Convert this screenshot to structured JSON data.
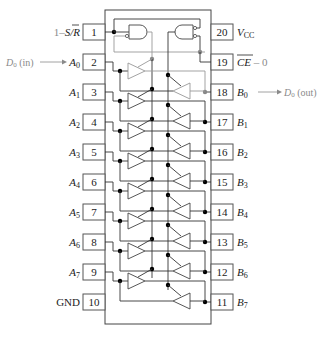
{
  "diagram": {
    "left_pins": [
      {
        "num": "1",
        "label": "1–S/R̄",
        "label_html_parts": {
          "prefix": "1–",
          "main": "S/",
          "over": "R"
        }
      },
      {
        "num": "2",
        "label": "A",
        "sub": "0"
      },
      {
        "num": "3",
        "label": "A",
        "sub": "1"
      },
      {
        "num": "4",
        "label": "A",
        "sub": "2"
      },
      {
        "num": "5",
        "label": "A",
        "sub": "3"
      },
      {
        "num": "6",
        "label": "A",
        "sub": "4"
      },
      {
        "num": "7",
        "label": "A",
        "sub": "5"
      },
      {
        "num": "8",
        "label": "A",
        "sub": "6"
      },
      {
        "num": "9",
        "label": "A",
        "sub": "7"
      },
      {
        "num": "10",
        "label": "GND",
        "sub": ""
      }
    ],
    "right_pins": [
      {
        "num": "20",
        "label": "V",
        "sub": "CC"
      },
      {
        "num": "19",
        "label": "CE",
        "sub": "",
        "suffix": "– 0",
        "overline": true
      },
      {
        "num": "18",
        "label": "B",
        "sub": "0"
      },
      {
        "num": "17",
        "label": "B",
        "sub": "1"
      },
      {
        "num": "16",
        "label": "B",
        "sub": "2"
      },
      {
        "num": "15",
        "label": "B",
        "sub": "3"
      },
      {
        "num": "14",
        "label": "B",
        "sub": "4"
      },
      {
        "num": "13",
        "label": "B",
        "sub": "5"
      },
      {
        "num": "12",
        "label": "B",
        "sub": "6"
      },
      {
        "num": "11",
        "label": "B",
        "sub": "7"
      }
    ],
    "annotations": {
      "input": {
        "label": "D",
        "sub": "0",
        "suffix": " (in)"
      },
      "output": {
        "label": "D",
        "sub": "0",
        "suffix": " (out)"
      }
    },
    "colors": {
      "line": "#333333",
      "annotation": "#8a8a8a"
    }
  }
}
